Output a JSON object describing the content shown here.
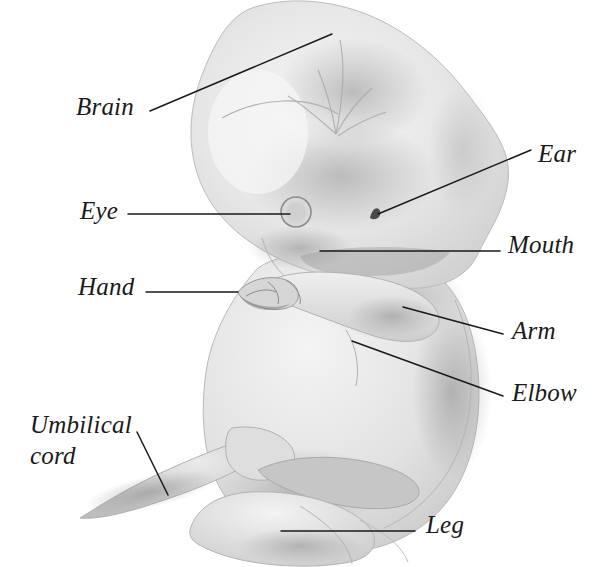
{
  "figure": {
    "kind": "anatomical-illustration",
    "background_color": "#ffffff",
    "ink_color": "#1a1a1a",
    "tissue_color": "#dcdcdc"
  },
  "labels": [
    {
      "id": "brain",
      "text": "Brain",
      "x": 76,
      "y": 92,
      "lines": [
        "Brain"
      ]
    },
    {
      "id": "eye",
      "text": "Eye",
      "x": 80,
      "y": 196,
      "lines": [
        "Eye"
      ]
    },
    {
      "id": "hand",
      "text": "Hand",
      "x": 78,
      "y": 272,
      "lines": [
        "Hand"
      ]
    },
    {
      "id": "umbilical-cord",
      "text": "Umbilical cord",
      "x": 30,
      "y": 410,
      "lines": [
        "Umbilical",
        "cord"
      ]
    },
    {
      "id": "ear",
      "text": "Ear",
      "x": 538,
      "y": 139,
      "lines": [
        "Ear"
      ]
    },
    {
      "id": "mouth",
      "text": "Mouth",
      "x": 508,
      "y": 230,
      "lines": [
        "Mouth"
      ]
    },
    {
      "id": "arm",
      "text": "Arm",
      "x": 512,
      "y": 316,
      "lines": [
        "Arm"
      ]
    },
    {
      "id": "elbow",
      "text": "Elbow",
      "x": 512,
      "y": 378,
      "lines": [
        "Elbow"
      ]
    },
    {
      "id": "leg",
      "text": "Leg",
      "x": 426,
      "y": 510,
      "lines": [
        "Leg"
      ]
    }
  ],
  "leader_lines": [
    {
      "id": "brain-leader",
      "points": "150,111 332,34"
    },
    {
      "id": "eye-leader",
      "points": "128,214 290,214"
    },
    {
      "id": "hand-leader",
      "points": "146,292 238,292"
    },
    {
      "id": "umbilical-leader",
      "points": "137,432 168,495"
    },
    {
      "id": "ear-leader",
      "points": "378,214 531,150"
    },
    {
      "id": "mouth-leader",
      "points": "320,251 500,251"
    },
    {
      "id": "arm-leader",
      "points": "403,307 503,334"
    },
    {
      "id": "elbow-leader",
      "points": "352,341 503,396"
    },
    {
      "id": "leg-leader",
      "points": "281,531 415,531"
    }
  ]
}
